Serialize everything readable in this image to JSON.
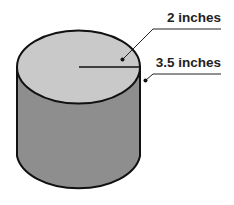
{
  "diagram": {
    "type": "cylinder",
    "labels": {
      "radius": "2 inches",
      "height": "3.5 inches"
    },
    "colors": {
      "top": "#c9c9c9",
      "side": "#8e8e8e",
      "outline": "#111111",
      "text": "#222222"
    }
  }
}
